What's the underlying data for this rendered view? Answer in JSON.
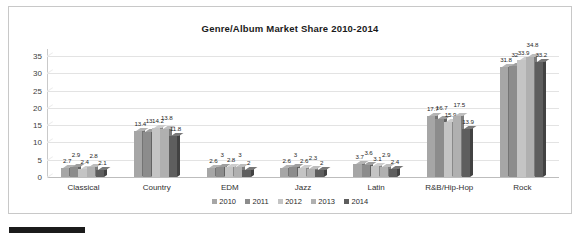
{
  "chart_data": {
    "type": "bar",
    "title": "Genre/Album Market Share 2010-2014",
    "xlabel": "",
    "ylabel": "",
    "ylim": [
      0,
      37
    ],
    "yticks": [
      "0",
      "5",
      "10",
      "15",
      "20",
      "25",
      "30",
      "35"
    ],
    "grid": true,
    "legend_position": "bottom",
    "categories": [
      "Classical",
      "Country",
      "EDM",
      "Jazz",
      "Latin",
      "R&B/Hip-Hop",
      "Rock"
    ],
    "series": [
      {
        "name": "2010",
        "color": "#a6a6a6",
        "values": [
          2.7,
          13.4,
          2.6,
          2.6,
          3.7,
          17.7,
          31.8
        ]
      },
      {
        "name": "2011",
        "color": "#8c8c8c",
        "values": [
          2.9,
          13,
          3,
          3,
          3.6,
          16.7,
          32
        ]
      },
      {
        "name": "2012",
        "color": "#c4c4c4",
        "values": [
          2.4,
          14.2,
          2.8,
          2.6,
          3.1,
          15.9,
          33.9
        ]
      },
      {
        "name": "2013",
        "color": "#b0b0b0",
        "values": [
          2.8,
          13.8,
          3,
          2.3,
          2.9,
          17.5,
          34.8
        ]
      },
      {
        "name": "2014",
        "color": "#5e5e5e",
        "values": [
          2.1,
          11.8,
          2,
          2,
          2.4,
          13.9,
          33.2
        ]
      }
    ]
  }
}
